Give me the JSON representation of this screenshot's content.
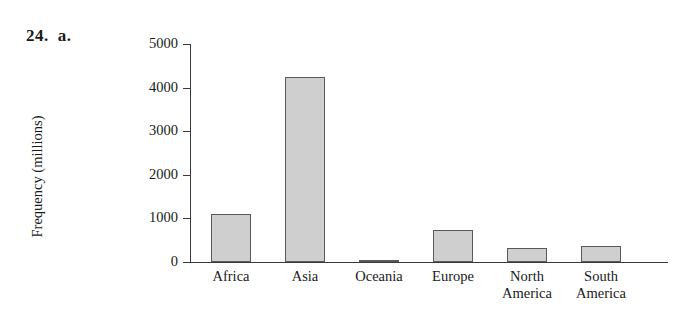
{
  "problem": {
    "number": "24.",
    "part": "a."
  },
  "chart_data": {
    "type": "bar",
    "title": "",
    "subtitle": "",
    "xlabel": "",
    "ylabel": "Frequency (millions)",
    "categories": [
      "Africa",
      "Asia",
      "Oceania",
      "Europe",
      "North America",
      "South America"
    ],
    "values": [
      1100,
      4250,
      35,
      730,
      330,
      370
    ],
    "ylim": [
      0,
      5000
    ],
    "yticks": [
      0,
      1000,
      2000,
      3000,
      4000,
      5000
    ],
    "ytick_labels": [
      "0",
      "1000",
      "2000",
      "3000",
      "4000",
      "5000"
    ],
    "grid": false,
    "legend": false,
    "bar_color": "#cfcfcf",
    "bar_edge_color": "#5a5a5a",
    "axis_color": "#3a3a3a"
  }
}
